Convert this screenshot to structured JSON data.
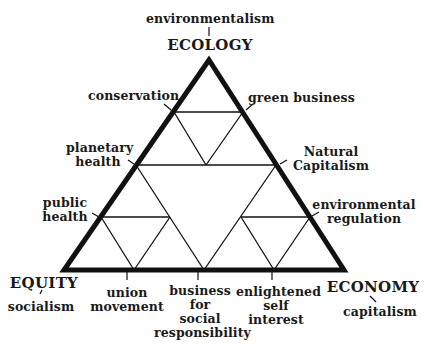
{
  "diagram": {
    "vertices": {
      "ecology": {
        "label": "ECOLOGY",
        "ideology": "environmentalism"
      },
      "equity": {
        "label": "EQUITY",
        "ideology": "socialism"
      },
      "economy": {
        "label": "ECONOMY",
        "ideology": "capitalism"
      }
    },
    "edge_labels": {
      "conservation": "conservation",
      "green_business": "green business",
      "planetary_health_1": "planetary",
      "planetary_health_2": "health",
      "natural_capitalism_1": "Natural",
      "natural_capitalism_2": "Capitalism",
      "public_health_1": "public",
      "public_health_2": "health",
      "environmental_regulation_1": "environmental",
      "environmental_regulation_2": "regulation",
      "union_movement_1": "union",
      "union_movement_2": "movement",
      "business_social_1": "business",
      "business_social_2": "for",
      "business_social_3": "social",
      "business_social_4": "responsibility",
      "enlightened_1": "enlightened",
      "enlightened_2": "self",
      "enlightened_3": "interest"
    },
    "colors": {
      "line": "#111111",
      "background": "#ffffff"
    }
  }
}
